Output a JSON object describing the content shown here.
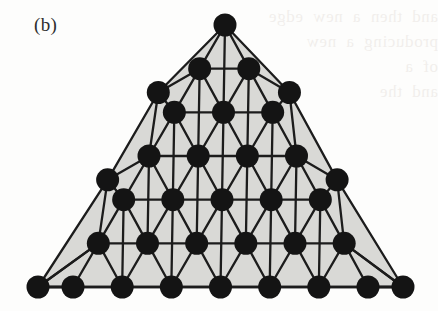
{
  "figure": {
    "panel_label": "(b)",
    "caption_text": "",
    "kind": "triangular-lattice-graph"
  },
  "colors": {
    "background": "#fdfdfc",
    "interior_fill": "#d9d9d6",
    "edge_stroke": "#1c1c1c",
    "node_fill": "#141414",
    "label_text": "#2e2e2e",
    "bleed_through_text": "#7a5c4a"
  },
  "geometry": {
    "apex": [
      225,
      25
    ],
    "bottom_left": [
      38,
      287
    ],
    "bottom_right": [
      403,
      287
    ],
    "rows": 6,
    "node_radius": 11.5,
    "edge_stroke_width": 2.3,
    "lattice_inset_left": [
      73,
      287
    ],
    "lattice_inset_right": [
      368,
      287
    ]
  },
  "chart_data": {
    "type": "scatter",
    "title": "(b)",
    "xlabel": "",
    "ylabel": "",
    "grid": false,
    "legend": null,
    "node_count": 34,
    "lattice_subdivisions": 6,
    "main_lattice_rows": [
      {
        "row": 0,
        "count": 1
      },
      {
        "row": 1,
        "count": 2
      },
      {
        "row": 2,
        "count": 3
      },
      {
        "row": 3,
        "count": 4
      },
      {
        "row": 4,
        "count": 5
      },
      {
        "row": 5,
        "count": 6
      },
      {
        "row": 6,
        "count": 7
      }
    ],
    "extra_left_edge_nodes": 3,
    "extra_right_edge_nodes": 3
  },
  "bleed_through": {
    "line1": "and  then  a  new  edge",
    "line2": "producing  a  new",
    "line3": "of  a",
    "line4": "and  the"
  }
}
